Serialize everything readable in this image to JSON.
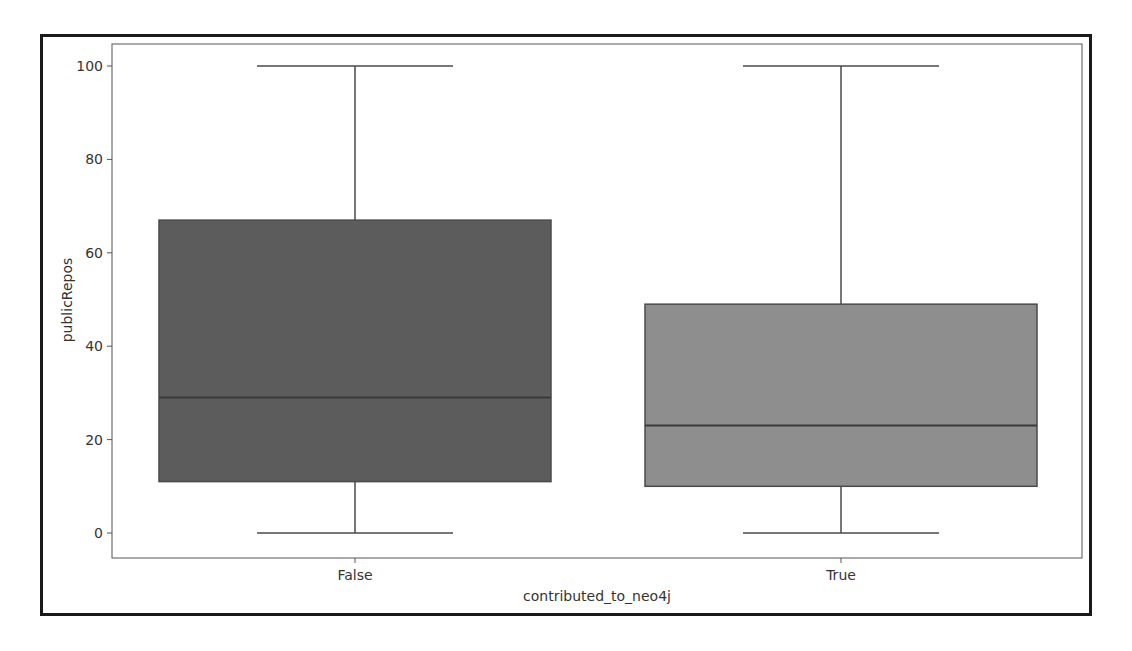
{
  "chart_data": {
    "type": "box",
    "title": "",
    "xlabel": "contributed_to_neo4j",
    "ylabel": "publicRepos",
    "categories": [
      "False",
      "True"
    ],
    "ylim": [
      -5,
      105
    ],
    "yticks": [
      0,
      20,
      40,
      60,
      80,
      100
    ],
    "grid": false,
    "legend": null,
    "series": [
      {
        "name": "False",
        "whisker_low": 0,
        "q1": 11,
        "median": 29,
        "q3": 67,
        "whisker_high": 100,
        "color": "#5c5c5c"
      },
      {
        "name": "True",
        "whisker_low": 0,
        "q1": 10,
        "median": 23,
        "q3": 49,
        "whisker_high": 100,
        "color": "#8e8e8e"
      }
    ]
  },
  "axes": {
    "xlabel": "contributed_to_neo4j",
    "ylabel": "publicRepos",
    "xticks": [
      "False",
      "True"
    ],
    "yticks": [
      "0",
      "20",
      "40",
      "60",
      "80",
      "100"
    ]
  }
}
